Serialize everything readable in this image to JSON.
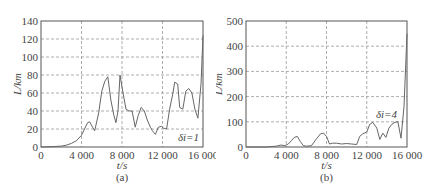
{
  "chart_data": [
    {
      "type": "line",
      "panel_label": "(a)",
      "title": "",
      "xlabel": "t/s",
      "ylabel": "L/km",
      "xlim": [
        0,
        16000
      ],
      "ylim": [
        0,
        140
      ],
      "xticks": [
        0,
        4000,
        8000,
        12000,
        16000
      ],
      "xtick_labels": [
        "0",
        "4 000",
        "8 000",
        "12 000",
        "16 000"
      ],
      "yticks": [
        0,
        20,
        40,
        60,
        80,
        100,
        120,
        140
      ],
      "ytick_labels": [
        "0",
        "20",
        "40",
        "60",
        "80",
        "100",
        "120",
        "140"
      ],
      "grid": true,
      "annotation": "δi=1",
      "series": [
        {
          "name": "δi=1",
          "x": [
            0,
            1000,
            2000,
            2500,
            3000,
            3500,
            4000,
            4300,
            4600,
            4800,
            5100,
            5300,
            5700,
            6000,
            6300,
            6600,
            6900,
            7200,
            7400,
            7600,
            7800,
            8100,
            8400,
            8700,
            9000,
            9300,
            9600,
            9900,
            10200,
            10500,
            10800,
            11000,
            11300,
            11600,
            11900,
            12100,
            12400,
            12700,
            13000,
            13200,
            13500,
            13700,
            14000,
            14300,
            14600,
            14900,
            15200,
            15500,
            15800,
            16000
          ],
          "y": [
            0,
            0.3,
            1,
            2,
            4,
            7,
            13,
            20,
            27,
            28,
            22,
            18,
            38,
            62,
            73,
            78,
            52,
            35,
            27,
            40,
            80,
            60,
            42,
            40,
            40,
            22,
            35,
            44,
            40,
            30,
            22,
            18,
            14,
            22,
            23,
            21,
            20,
            42,
            58,
            72,
            70,
            44,
            42,
            62,
            65,
            60,
            42,
            32,
            70,
            124
          ]
        }
      ]
    },
    {
      "type": "line",
      "panel_label": "(b)",
      "title": "",
      "xlabel": "t/s",
      "ylabel": "L/km",
      "xlim": [
        0,
        16000
      ],
      "ylim": [
        0,
        500
      ],
      "xticks": [
        0,
        4000,
        8000,
        12000,
        16000
      ],
      "xtick_labels": [
        "0",
        "4 000",
        "8 000",
        "12 000",
        "16 000"
      ],
      "yticks": [
        0,
        100,
        200,
        300,
        400,
        500
      ],
      "ytick_labels": [
        "0",
        "100",
        "200",
        "300",
        "400",
        "500"
      ],
      "grid": true,
      "annotation": "δi=4",
      "series": [
        {
          "name": "δi=4",
          "x": [
            0,
            2000,
            3000,
            3500,
            3800,
            4000,
            4200,
            4500,
            4800,
            5100,
            5400,
            5700,
            6000,
            6500,
            7000,
            7400,
            7700,
            8000,
            8300,
            8600,
            9000,
            9500,
            10000,
            10500,
            11000,
            11300,
            11600,
            12000,
            12300,
            12600,
            13000,
            13300,
            13600,
            13900,
            14200,
            14500,
            14800,
            15100,
            15400,
            15700,
            16000
          ],
          "y": [
            0,
            0,
            3,
            8,
            5,
            8,
            12,
            25,
            38,
            42,
            22,
            5,
            3,
            5,
            32,
            52,
            55,
            42,
            12,
            15,
            15,
            12,
            14,
            12,
            10,
            42,
            52,
            60,
            90,
            98,
            75,
            30,
            55,
            38,
            75,
            90,
            98,
            100,
            35,
            160,
            450
          ]
        }
      ]
    }
  ]
}
